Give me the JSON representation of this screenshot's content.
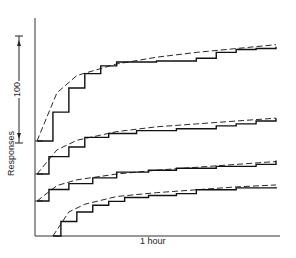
{
  "chart_data": {
    "type": "line",
    "title": "",
    "xlabel": "1 hour",
    "ylabel": "Responses",
    "scale_bar": {
      "label": "100",
      "units": "responses"
    },
    "grid": false,
    "legend": null,
    "x_range": [
      0,
      60
    ],
    "x_units": "minutes",
    "series": [
      {
        "name": "Record 1 (top)",
        "style": "solid stepped",
        "x": [
          0,
          4,
          8,
          12,
          16,
          20,
          30,
          40,
          45,
          50,
          55,
          60
        ],
        "y": [
          0,
          30,
          55,
          70,
          78,
          82,
          83,
          86,
          92,
          95,
          96,
          98
        ]
      },
      {
        "name": "Record 1 fit",
        "style": "dashed",
        "x": [
          0,
          5,
          10,
          20,
          30,
          40,
          50,
          60
        ],
        "y": [
          0,
          50,
          68,
          80,
          87,
          92,
          96,
          100
        ]
      },
      {
        "name": "Record 2",
        "style": "solid stepped",
        "x": [
          0,
          3,
          8,
          12,
          18,
          25,
          35,
          45,
          50,
          55,
          60
        ],
        "y": [
          0,
          18,
          28,
          38,
          42,
          45,
          47,
          50,
          52,
          55,
          58
        ]
      },
      {
        "name": "Record 2 fit",
        "style": "dashed",
        "x": [
          0,
          5,
          10,
          20,
          30,
          40,
          50,
          60
        ],
        "y": [
          0,
          25,
          35,
          44,
          49,
          52,
          55,
          58
        ]
      },
      {
        "name": "Record 3",
        "style": "solid stepped",
        "x": [
          0,
          3,
          8,
          14,
          20,
          28,
          35,
          45,
          55,
          60
        ],
        "y": [
          0,
          12,
          18,
          24,
          30,
          32,
          34,
          36,
          38,
          42
        ]
      },
      {
        "name": "Record 3 fit",
        "style": "dashed",
        "x": [
          0,
          5,
          10,
          20,
          30,
          40,
          50,
          60
        ],
        "y": [
          0,
          16,
          22,
          28,
          32,
          35,
          38,
          41
        ]
      },
      {
        "name": "Record 4 (bottom)",
        "style": "solid stepped",
        "x": [
          4,
          6,
          10,
          14,
          18,
          22,
          28,
          35,
          40,
          50,
          60
        ],
        "y": [
          0,
          15,
          25,
          32,
          36,
          40,
          42,
          44,
          48,
          50,
          51
        ]
      },
      {
        "name": "Record 4 fit",
        "style": "dashed",
        "x": [
          4,
          8,
          12,
          20,
          30,
          40,
          50,
          60
        ],
        "y": [
          0,
          25,
          33,
          41,
          45,
          48,
          51,
          53
        ]
      }
    ]
  }
}
